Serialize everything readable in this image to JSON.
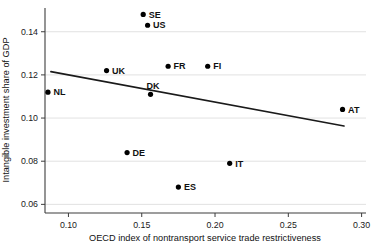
{
  "chart_data": {
    "type": "scatter",
    "title": "",
    "xlabel": "OECD index of nontransport service trade restrictiveness",
    "ylabel": "Intangible investment share of GDP",
    "xlim": [
      0.084,
      0.303
    ],
    "ylim": [
      0.056,
      0.151
    ],
    "x_ticks": [
      0.1,
      0.15,
      0.2,
      0.25,
      0.3
    ],
    "y_ticks": [
      0.06,
      0.08,
      0.1,
      0.12,
      0.14
    ],
    "grid": "horizontal-only",
    "legend": "none",
    "points": [
      {
        "label": "SE",
        "x": 0.151,
        "y": 0.148,
        "label_pos": "right"
      },
      {
        "label": "US",
        "x": 0.154,
        "y": 0.143,
        "label_pos": "right"
      },
      {
        "label": "UK",
        "x": 0.126,
        "y": 0.122,
        "label_pos": "right"
      },
      {
        "label": "FR",
        "x": 0.168,
        "y": 0.124,
        "label_pos": "right"
      },
      {
        "label": "FI",
        "x": 0.195,
        "y": 0.124,
        "label_pos": "right"
      },
      {
        "label": "NL",
        "x": 0.086,
        "y": 0.112,
        "label_pos": "right"
      },
      {
        "label": "DK",
        "x": 0.156,
        "y": 0.111,
        "label_pos": "above"
      },
      {
        "label": "DE",
        "x": 0.14,
        "y": 0.084,
        "label_pos": "right"
      },
      {
        "label": "ES",
        "x": 0.175,
        "y": 0.068,
        "label_pos": "right"
      },
      {
        "label": "IT",
        "x": 0.21,
        "y": 0.079,
        "label_pos": "right"
      },
      {
        "label": "AT",
        "x": 0.287,
        "y": 0.104,
        "label_pos": "right"
      }
    ],
    "trend_line": {
      "x1": 0.088,
      "y1": 0.1215,
      "x2": 0.288,
      "y2": 0.0963
    },
    "colors": {
      "point": "#000000",
      "trend": "#1a1a1a",
      "grid": "#d9d9d9",
      "axis": "#3d3d3d",
      "text": "#111111",
      "background": "#ffffff"
    }
  }
}
